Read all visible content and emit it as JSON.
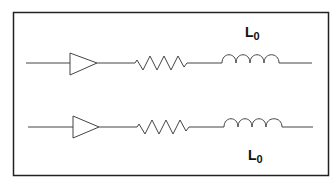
{
  "diagram": {
    "type": "circuit-schematic",
    "frame": {
      "stroke": "#222222"
    },
    "colors": {
      "wire": "#444444",
      "text": "#111111",
      "background": "#ffffff"
    },
    "rows": [
      {
        "name": "top-line",
        "components": [
          "amplifier",
          "resistor",
          "inductor"
        ],
        "label": {
          "main": "L",
          "sub": "0",
          "position": "above-inductor"
        }
      },
      {
        "name": "bottom-line",
        "components": [
          "amplifier",
          "resistor",
          "inductor"
        ],
        "label": {
          "main": "L",
          "sub": "0",
          "position": "below-inductor"
        }
      }
    ]
  }
}
